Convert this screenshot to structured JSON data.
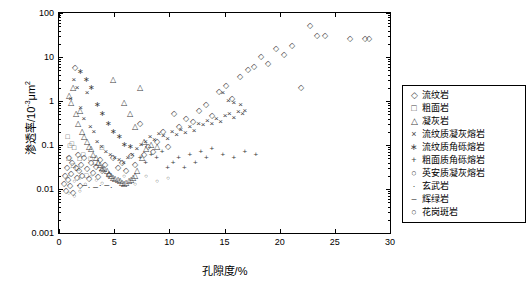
{
  "chart_data": {
    "type": "scatter",
    "title": "",
    "xlabel": "孔隙度/%",
    "ylabel_pre": "渗透率/10",
    "ylabel_sup": "-3",
    "ylabel_post": "μm",
    "ylabel_sup2": "2",
    "xlim": [
      0,
      30
    ],
    "ylim": [
      0.001,
      100
    ],
    "yscale": "log",
    "grid": false,
    "xticks": [
      "0",
      "5",
      "10",
      "15",
      "20",
      "25",
      "30"
    ],
    "yticks": [
      "0.001",
      "0.01",
      "0.1",
      "1",
      "10",
      "100"
    ],
    "legend_position": "right",
    "legend": [
      {
        "label": "流纹岩",
        "marker": "diamond"
      },
      {
        "label": "粗面岩",
        "marker": "square"
      },
      {
        "label": "凝灰岩",
        "marker": "triangle"
      },
      {
        "label": "流纹质凝灰熔岩",
        "marker": "x"
      },
      {
        "label": "流纹质角砾熔岩",
        "marker": "star"
      },
      {
        "label": "粗面质角砾熔岩",
        "marker": "plus"
      },
      {
        "label": "英安质凝灰熔岩",
        "marker": "circle"
      },
      {
        "label": "玄武岩",
        "marker": "dot"
      },
      {
        "label": "辉绿岩",
        "marker": "dash"
      },
      {
        "label": "花岗斑岩",
        "marker": "circle"
      }
    ],
    "series": [
      {
        "name": "流纹岩",
        "marker": "diamond",
        "points": [
          [
            0.5,
            0.013
          ],
          [
            0.6,
            0.02
          ],
          [
            0.7,
            0.009
          ],
          [
            0.8,
            0.03
          ],
          [
            0.9,
            0.016
          ],
          [
            1.0,
            0.05
          ],
          [
            1.1,
            0.012
          ],
          [
            1.2,
            0.022
          ],
          [
            1.3,
            0.04
          ],
          [
            1.4,
            0.008
          ],
          [
            1.5,
            5.5
          ],
          [
            1.6,
            0.03
          ],
          [
            1.7,
            0.018
          ],
          [
            1.8,
            0.06
          ],
          [
            1.9,
            0.026
          ],
          [
            2.0,
            0.012
          ],
          [
            2.1,
            0.035
          ],
          [
            2.2,
            0.02
          ],
          [
            2.4,
            0.05
          ],
          [
            2.6,
            0.028
          ],
          [
            2.8,
            0.017
          ],
          [
            3.0,
            0.04
          ],
          [
            3.2,
            0.023
          ],
          [
            3.4,
            0.031
          ],
          [
            3.6,
            0.019
          ],
          [
            3.8,
            0.045
          ],
          [
            4.0,
            0.026
          ],
          [
            4.3,
            0.036
          ],
          [
            4.6,
            0.021
          ],
          [
            5.0,
            0.05
          ],
          [
            5.4,
            0.03
          ],
          [
            5.8,
            0.04
          ],
          [
            6.2,
            0.025
          ],
          [
            6.6,
            0.055
          ],
          [
            7.0,
            0.035
          ],
          [
            7.4,
            0.3
          ],
          [
            7.8,
            0.06
          ],
          [
            8.2,
            0.09
          ],
          [
            8.6,
            0.07
          ],
          [
            9.0,
            0.12
          ],
          [
            9.5,
            0.2
          ],
          [
            10.0,
            0.09
          ],
          [
            10.5,
            0.5
          ],
          [
            11.0,
            0.25
          ],
          [
            11.6,
            0.4
          ],
          [
            12.2,
            0.33
          ],
          [
            12.8,
            0.6
          ],
          [
            13.4,
            0.8
          ],
          [
            14.0,
            0.45
          ],
          [
            14.6,
            1.6
          ],
          [
            15.2,
            2.2
          ],
          [
            15.8,
            1.1
          ],
          [
            16.5,
            3.5
          ],
          [
            17.2,
            5.0
          ],
          [
            17.8,
            6.0
          ],
          [
            18.4,
            10.0
          ],
          [
            19.0,
            7.0
          ],
          [
            19.8,
            15.0
          ],
          [
            20.5,
            11.0
          ],
          [
            21.2,
            18.0
          ],
          [
            22.0,
            2.0
          ],
          [
            22.8,
            50.0
          ],
          [
            23.5,
            30.0
          ],
          [
            24.2,
            30.0
          ],
          [
            26.5,
            25.0
          ],
          [
            27.8,
            25.0
          ],
          [
            28.2,
            25.0
          ]
        ]
      },
      {
        "name": "粗面岩",
        "marker": "square",
        "points": [
          [
            0.9,
            0.16
          ],
          [
            1.1,
            0.1
          ],
          [
            1.3,
            0.11
          ],
          [
            1.5,
            0.09
          ],
          [
            1.0,
            0.05
          ],
          [
            1.4,
            0.035
          ],
          [
            1.8,
            0.03
          ],
          [
            2.0,
            0.05
          ],
          [
            2.3,
            0.06
          ],
          [
            2.6,
            0.02
          ],
          [
            3.0,
            0.05
          ],
          [
            3.4,
            0.04
          ],
          [
            4.0,
            0.09
          ]
        ]
      },
      {
        "name": "凝灰岩",
        "marker": "triangle",
        "points": [
          [
            1.0,
            1.3
          ],
          [
            1.2,
            0.9
          ],
          [
            1.4,
            2.0
          ],
          [
            1.6,
            0.5
          ],
          [
            1.8,
            0.3
          ],
          [
            2.0,
            0.6
          ],
          [
            2.2,
            0.2
          ],
          [
            2.4,
            0.15
          ],
          [
            2.6,
            0.12
          ],
          [
            2.8,
            0.09
          ],
          [
            3.0,
            0.08
          ],
          [
            3.2,
            0.06
          ],
          [
            3.4,
            0.05
          ],
          [
            3.6,
            0.04
          ],
          [
            3.8,
            0.035
          ],
          [
            4.0,
            0.03
          ],
          [
            4.2,
            0.028
          ],
          [
            4.4,
            0.025
          ],
          [
            4.6,
            0.022
          ],
          [
            4.8,
            0.02
          ],
          [
            5.0,
            0.018
          ],
          [
            5.2,
            0.017
          ],
          [
            5.4,
            0.016
          ],
          [
            5.6,
            0.015
          ],
          [
            5.8,
            0.014
          ],
          [
            6.0,
            0.013
          ],
          [
            6.2,
            0.014
          ],
          [
            6.4,
            0.015
          ],
          [
            6.6,
            0.016
          ],
          [
            6.8,
            0.018
          ],
          [
            7.0,
            0.02
          ],
          [
            7.2,
            0.025
          ],
          [
            7.4,
            2.0
          ],
          [
            7.6,
            0.05
          ],
          [
            8.0,
            0.08
          ],
          [
            5.0,
            3.0
          ],
          [
            6.0,
            0.9
          ],
          [
            6.5,
            0.5
          ],
          [
            7.0,
            0.25
          ],
          [
            7.8,
            0.12
          ],
          [
            8.4,
            0.1
          ],
          [
            9.0,
            0.09
          ]
        ]
      },
      {
        "name": "流纹质凝灰熔岩",
        "marker": "x",
        "points": [
          [
            1.2,
            1.1
          ],
          [
            1.5,
            3.0
          ],
          [
            1.8,
            2.0
          ],
          [
            2.1,
            0.7
          ],
          [
            2.4,
            0.4
          ],
          [
            2.7,
            1.5
          ],
          [
            3.0,
            0.25
          ],
          [
            3.3,
            0.2
          ],
          [
            3.6,
            0.12
          ],
          [
            4.0,
            0.09
          ],
          [
            4.4,
            0.07
          ],
          [
            4.8,
            0.06
          ],
          [
            5.2,
            0.05
          ],
          [
            5.6,
            0.045
          ],
          [
            6.0,
            0.04
          ],
          [
            6.4,
            0.05
          ],
          [
            6.8,
            0.06
          ],
          [
            7.2,
            0.08
          ],
          [
            7.6,
            0.1
          ],
          [
            8.0,
            0.12
          ],
          [
            8.4,
            0.15
          ],
          [
            8.8,
            0.13
          ],
          [
            9.2,
            0.18
          ],
          [
            9.6,
            0.16
          ],
          [
            10.0,
            0.14
          ],
          [
            10.4,
            0.2
          ],
          [
            10.8,
            0.17
          ],
          [
            11.2,
            0.22
          ],
          [
            11.6,
            0.19
          ],
          [
            12.0,
            0.25
          ],
          [
            12.4,
            0.21
          ],
          [
            12.8,
            0.3
          ],
          [
            13.2,
            0.28
          ],
          [
            13.6,
            0.35
          ],
          [
            14.0,
            0.3
          ],
          [
            14.4,
            0.4
          ],
          [
            14.8,
            0.33
          ],
          [
            15.2,
            0.45
          ],
          [
            15.6,
            0.5
          ],
          [
            16.0,
            0.42
          ],
          [
            16.4,
            0.55
          ],
          [
            16.8,
            0.5
          ],
          [
            17.0,
            0.6
          ],
          [
            15.0,
            1.5
          ],
          [
            15.5,
            1.0
          ],
          [
            16.0,
            0.9
          ],
          [
            16.6,
            0.8
          ]
        ]
      },
      {
        "name": "流纹质角砾熔岩",
        "marker": "star",
        "points": [
          [
            2.0,
            4.5
          ],
          [
            2.5,
            3.0
          ],
          [
            3.0,
            2.0
          ],
          [
            3.5,
            0.8
          ],
          [
            4.0,
            0.5
          ],
          [
            4.5,
            0.3
          ],
          [
            5.0,
            0.2
          ],
          [
            5.5,
            0.15
          ],
          [
            6.0,
            0.1
          ],
          [
            6.5,
            0.09
          ]
        ]
      },
      {
        "name": "粗面质角砾熔岩",
        "marker": "plus",
        "points": [
          [
            7.5,
            0.05
          ],
          [
            8.0,
            0.04
          ],
          [
            8.5,
            0.06
          ],
          [
            9.0,
            0.05
          ],
          [
            9.5,
            0.07
          ],
          [
            10.0,
            0.03
          ],
          [
            10.5,
            0.04
          ],
          [
            11.0,
            0.05
          ],
          [
            11.5,
            0.03
          ],
          [
            12.0,
            0.06
          ],
          [
            12.5,
            0.04
          ],
          [
            13.0,
            0.07
          ],
          [
            13.5,
            0.05
          ],
          [
            14.0,
            0.08
          ],
          [
            15.0,
            0.06
          ],
          [
            16.0,
            0.05
          ],
          [
            17.0,
            0.07
          ],
          [
            18.0,
            0.06
          ]
        ]
      },
      {
        "name": "英安质凝灰熔岩",
        "marker": "circle",
        "points": [
          [
            1.0,
            0.02
          ],
          [
            1.5,
            0.015
          ],
          [
            2.0,
            0.018
          ],
          [
            2.5,
            0.013
          ],
          [
            3.0,
            0.02
          ],
          [
            3.5,
            0.016
          ],
          [
            4.0,
            0.014
          ],
          [
            4.5,
            0.02
          ],
          [
            5.0,
            0.017
          ],
          [
            5.5,
            0.015
          ],
          [
            6.0,
            0.02
          ],
          [
            7.0,
            0.013
          ],
          [
            8.0,
            0.02
          ],
          [
            9.0,
            0.015
          ],
          [
            10.0,
            0.018
          ]
        ]
      },
      {
        "name": "玄武岩",
        "marker": "dot",
        "points": [
          [
            2.0,
            0.012
          ],
          [
            3.0,
            0.011
          ],
          [
            4.0,
            0.012
          ],
          [
            5.0,
            0.011
          ],
          [
            6.0,
            0.012
          ]
        ]
      },
      {
        "name": "辉绿岩",
        "marker": "dash",
        "points": [
          [
            2.5,
            0.012
          ],
          [
            3.5,
            0.011
          ],
          [
            4.5,
            0.012
          ]
        ]
      },
      {
        "name": "花岗斑岩",
        "marker": "circle",
        "points": [
          [
            1.0,
            0.008
          ],
          [
            1.5,
            0.007
          ],
          [
            2.0,
            0.009
          ]
        ]
      }
    ]
  }
}
